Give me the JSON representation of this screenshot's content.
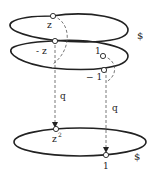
{
  "diagram": {
    "top_circle_label": "$",
    "bottom_circle_label": "$",
    "points_top": {
      "z": "z",
      "minus_z": "- z",
      "one": "1",
      "minus_one": "− 1"
    },
    "points_bottom": {
      "z_squared_base": "z",
      "z_squared_exp": "2",
      "one": "1"
    },
    "map_labels": {
      "left": "q",
      "right": "q"
    }
  }
}
